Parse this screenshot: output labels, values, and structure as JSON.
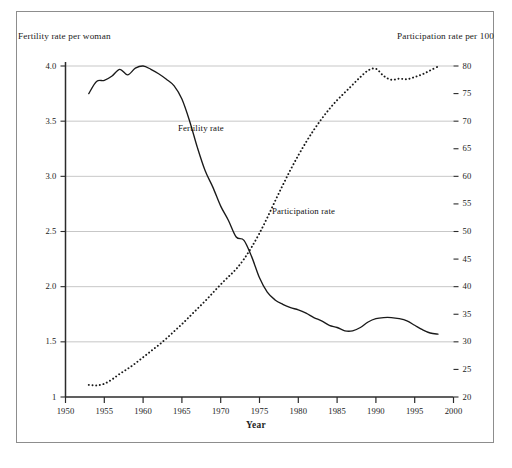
{
  "figure": {
    "left_axis_title": "Fertility rate per woman",
    "right_axis_title": "Participation rate per 100",
    "x_axis_title": "Year"
  },
  "annotations": {
    "fertility": "Fertility rate",
    "participation": "Participation rate"
  },
  "colors": {
    "ink": "#1a1a1a",
    "grid": "#b9b9b9",
    "axis": "#2b2b2b",
    "frame": "#8d8d8d",
    "background": "#ffffff"
  },
  "chart_data": {
    "type": "line",
    "title": "",
    "subtitle": "",
    "xlabel": "Year",
    "ylabel": "Fertility rate per woman",
    "y2label": "Participation rate per 100",
    "xlim": [
      1950,
      2000
    ],
    "ylim": [
      1.0,
      4.0
    ],
    "y2lim": [
      20,
      80
    ],
    "grid": true,
    "grid_axis": "y",
    "legend": "inline-annotations",
    "xticks": [
      1950,
      1955,
      1960,
      1965,
      1970,
      1975,
      1980,
      1985,
      1990,
      1995,
      2000
    ],
    "xticklabels": [
      "1950",
      "1955",
      "1960",
      "1965",
      "1970",
      "1975",
      "1980",
      "1985",
      "1990",
      "1995",
      "2000"
    ],
    "yticks": [
      1,
      1.5,
      2.0,
      2.5,
      3.0,
      3.5,
      4.0
    ],
    "yticklabels": [
      "1",
      "1.5",
      "2.0",
      "2.5",
      "3.0",
      "3.5",
      "4.0"
    ],
    "y2ticks": [
      20,
      25,
      30,
      35,
      40,
      45,
      50,
      55,
      60,
      65,
      70,
      75,
      80
    ],
    "y2ticklabels": [
      "20",
      "25",
      "30",
      "35",
      "40",
      "45",
      "50",
      "55",
      "60",
      "65",
      "70",
      "75",
      "80"
    ],
    "series": [
      {
        "name": "Fertility rate",
        "axis": "left",
        "style": "solid",
        "color": "#1a1a1a",
        "x": [
          1953,
          1954,
          1955,
          1956,
          1957,
          1958,
          1959,
          1960,
          1961,
          1962,
          1963,
          1964,
          1965,
          1966,
          1967,
          1968,
          1969,
          1970,
          1971,
          1972,
          1973,
          1974,
          1975,
          1976,
          1977,
          1978,
          1979,
          1980,
          1981,
          1982,
          1983,
          1984,
          1985,
          1986,
          1987,
          1988,
          1989,
          1990,
          1991,
          1992,
          1993,
          1994,
          1995,
          1996,
          1997,
          1998
        ],
        "y": [
          3.75,
          3.86,
          3.87,
          3.91,
          3.97,
          3.92,
          3.98,
          4.0,
          3.97,
          3.93,
          3.88,
          3.82,
          3.7,
          3.5,
          3.26,
          3.05,
          2.9,
          2.73,
          2.6,
          2.45,
          2.42,
          2.27,
          2.08,
          1.95,
          1.88,
          1.84,
          1.81,
          1.79,
          1.76,
          1.72,
          1.69,
          1.65,
          1.63,
          1.6,
          1.6,
          1.63,
          1.68,
          1.71,
          1.72,
          1.72,
          1.71,
          1.69,
          1.65,
          1.61,
          1.58,
          1.57
        ]
      },
      {
        "name": "Participation rate",
        "axis": "right",
        "style": "dotted",
        "color": "#1a1a1a",
        "x": [
          1953,
          1954,
          1955,
          1956,
          1957,
          1958,
          1959,
          1960,
          1961,
          1962,
          1963,
          1964,
          1965,
          1966,
          1967,
          1968,
          1969,
          1970,
          1971,
          1972,
          1973,
          1974,
          1975,
          1976,
          1977,
          1978,
          1979,
          1980,
          1981,
          1982,
          1983,
          1984,
          1985,
          1986,
          1987,
          1988,
          1989,
          1990,
          1991,
          1992,
          1993,
          1994,
          1995,
          1996,
          1997,
          1998
        ],
        "y": [
          22.2,
          22.1,
          22.4,
          23.2,
          24.2,
          25.1,
          26.1,
          27.2,
          28.3,
          29.4,
          30.6,
          31.9,
          33.2,
          34.6,
          36.0,
          37.4,
          38.9,
          40.4,
          41.8,
          43.2,
          45.0,
          47.2,
          49.7,
          52.5,
          55.5,
          58.4,
          61.2,
          63.8,
          66.2,
          68.4,
          70.4,
          72.2,
          73.8,
          75.2,
          76.6,
          78.0,
          79.2,
          79.5,
          78.2,
          77.5,
          77.7,
          77.6,
          78.0,
          78.5,
          79.2,
          79.9
        ]
      }
    ],
    "notes": {
      "crossover_year": 1972,
      "fertility_peak": {
        "year": 1960,
        "value": 4.0
      },
      "fertility_min": {
        "year": 1998,
        "value": 1.57
      },
      "participation_start": {
        "year": 1953,
        "value": 22.2
      },
      "participation_end": {
        "year": 1998,
        "value": 79.9
      }
    }
  }
}
